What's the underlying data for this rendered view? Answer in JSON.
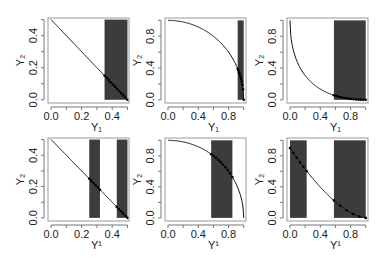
{
  "chart_data": [
    {
      "type": "line",
      "panel": "row1-col1",
      "frame": {
        "x": 48,
        "y": 18,
        "w": 81,
        "h": 85
      },
      "xlim": [
        -0.02,
        0.51
      ],
      "ylim": [
        -0.02,
        0.51
      ],
      "xticks": [
        0.0,
        0.2,
        0.4
      ],
      "xtick_labels": [
        "0.0",
        "0.2",
        "0.4"
      ],
      "yticks": [
        0.0,
        0.2,
        0.4
      ],
      "ytick_labels": [
        "0.0",
        "0.2",
        "0.4"
      ],
      "xminor": [
        0.1,
        0.3,
        0.5
      ],
      "yminor": [
        0.1,
        0.3,
        0.5
      ],
      "xlabel": "Y₁",
      "ylabel": "Y₂",
      "curve": "linear",
      "curve_params": {
        "x0": 0.0,
        "x1": 0.5
      },
      "shaded_regions": [
        [
          0.35,
          0.5
        ]
      ],
      "points_range": [
        0.35,
        0.5
      ],
      "n_points": 12
    },
    {
      "type": "line",
      "panel": "row1-col2",
      "frame": {
        "x": 165,
        "y": 18,
        "w": 81,
        "h": 85
      },
      "xlim": [
        -0.04,
        1.03
      ],
      "ylim": [
        -0.04,
        1.03
      ],
      "xticks": [
        0.0,
        0.4,
        0.8
      ],
      "xtick_labels": [
        "0.0",
        "0.4",
        "0.8"
      ],
      "yticks": [
        0.0,
        0.4,
        0.8
      ],
      "ytick_labels": [
        "0.0",
        "0.4",
        "0.8"
      ],
      "xminor": [
        0.2,
        0.6,
        1.0
      ],
      "yminor": [
        0.2,
        0.6,
        1.0
      ],
      "xlabel": "Y₁",
      "ylabel": "Y₂",
      "curve": "concave",
      "curve_params": {
        "x0": 0.0,
        "x1": 1.0
      },
      "shaded_regions": [
        [
          0.92,
          1.0
        ]
      ],
      "points_range": [
        0.92,
        1.0
      ],
      "n_points": 10
    },
    {
      "type": "line",
      "panel": "row1-col3",
      "frame": {
        "x": 287,
        "y": 18,
        "w": 81,
        "h": 85
      },
      "xlim": [
        -0.04,
        1.03
      ],
      "ylim": [
        -0.04,
        1.03
      ],
      "xticks": [
        0.0,
        0.4,
        0.8
      ],
      "xtick_labels": [
        "0.0",
        "0.4",
        "0.8"
      ],
      "yticks": [
        0.0,
        0.4,
        0.8
      ],
      "ytick_labels": [
        "0.0",
        "0.4",
        "0.8"
      ],
      "xminor": [
        0.2,
        0.6,
        1.0
      ],
      "yminor": [
        0.2,
        0.6,
        1.0
      ],
      "xlabel": "Y₁",
      "ylabel": "Y₂",
      "curve": "convex",
      "curve_params": {
        "x0": 0.0,
        "x1": 1.0
      },
      "shaded_regions": [
        [
          0.58,
          1.0
        ]
      ],
      "points_range": [
        0.58,
        1.0
      ],
      "n_points": 14
    },
    {
      "type": "line",
      "panel": "row2-col1",
      "frame": {
        "x": 48,
        "y": 138,
        "w": 81,
        "h": 83
      },
      "xlim": [
        -0.02,
        0.51
      ],
      "ylim": [
        -0.02,
        0.51
      ],
      "xticks": [
        0.0,
        0.2,
        0.4
      ],
      "xtick_labels": [
        "0.0",
        "0.2",
        "0.4"
      ],
      "yticks": [
        0.0,
        0.2,
        0.4
      ],
      "ytick_labels": [
        "0.0",
        "0.2",
        "0.4"
      ],
      "xminor": [
        0.1,
        0.3,
        0.5
      ],
      "yminor": [
        0.1,
        0.3,
        0.5
      ],
      "xlabel": "Y¹",
      "ylabel": "Y₂",
      "curve": "linear",
      "curve_params": {
        "x0": 0.0,
        "x1": 0.5
      },
      "shaded_regions": [
        [
          0.25,
          0.32
        ],
        [
          0.43,
          0.5
        ]
      ],
      "points_ranges": [
        [
          0.25,
          0.32
        ],
        [
          0.43,
          0.5
        ]
      ],
      "n_points": 6
    },
    {
      "type": "line",
      "panel": "row2-col2",
      "frame": {
        "x": 165,
        "y": 138,
        "w": 81,
        "h": 83
      },
      "xlim": [
        -0.04,
        1.03
      ],
      "ylim": [
        -0.04,
        1.03
      ],
      "xticks": [
        0.0,
        0.4,
        0.8
      ],
      "xtick_labels": [
        "0.0",
        "0.4",
        "0.8"
      ],
      "yticks": [
        0.0,
        0.4,
        0.8
      ],
      "ytick_labels": [
        "0.0",
        "0.4",
        "0.8"
      ],
      "xminor": [
        0.2,
        0.6,
        1.0
      ],
      "yminor": [
        0.2,
        0.6,
        1.0
      ],
      "xlabel": "Y¹",
      "ylabel": "Y₂",
      "curve": "concave",
      "curve_params": {
        "x0": 0.0,
        "x1": 1.0
      },
      "shaded_regions": [
        [
          0.57,
          0.85
        ]
      ],
      "points_range": [
        0.57,
        0.85
      ],
      "n_points": 10
    },
    {
      "type": "line",
      "panel": "row2-col3",
      "frame": {
        "x": 287,
        "y": 138,
        "w": 81,
        "h": 83
      },
      "xlim": [
        -0.04,
        1.03
      ],
      "ylim": [
        -0.04,
        1.03
      ],
      "xticks": [
        0.0,
        0.4,
        0.8
      ],
      "xtick_labels": [
        "0.0",
        "0.4",
        "0.8"
      ],
      "yticks": [
        0.0,
        0.4,
        0.8
      ],
      "ytick_labels": [
        "0.0",
        "0.4",
        "0.8"
      ],
      "xminor": [
        0.2,
        0.6,
        1.0
      ],
      "yminor": [
        0.2,
        0.6,
        1.0
      ],
      "xlabel": "Y¹",
      "ylabel": "Y₂",
      "curve": "convex2",
      "curve_params": {
        "x0": 0.0,
        "x1": 1.0,
        "y0": 0.9
      },
      "shaded_regions": [
        [
          0.0,
          0.22
        ],
        [
          0.58,
          1.0
        ]
      ],
      "points_ranges": [
        [
          0.0,
          0.22
        ],
        [
          0.58,
          1.0
        ]
      ],
      "n_points": 6
    }
  ],
  "style": {
    "shade_color": "#3c3c3c",
    "line_color": "#111111",
    "point_color": "#000000",
    "frame_color": "#999999",
    "tick_color": "#777777",
    "text_color": "#222222"
  }
}
